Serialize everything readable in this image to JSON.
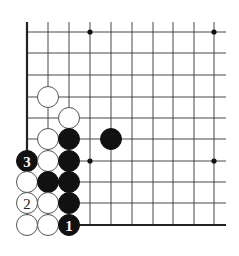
{
  "diagram": {
    "type": "go-board-fragment",
    "columns_x": [
      27,
      48,
      69,
      90,
      111,
      132,
      153,
      173,
      194,
      214
    ],
    "rows_y": [
      32,
      53,
      75,
      97,
      118,
      139,
      161,
      182,
      203,
      225
    ],
    "line_extent": {
      "top": 22,
      "right": 226
    },
    "edges": [
      "left",
      "bottom"
    ],
    "hoshi": [
      {
        "col": 3,
        "row": 0
      },
      {
        "col": 9,
        "row": 0
      },
      {
        "col": 3,
        "row": 6
      },
      {
        "col": 9,
        "row": 6
      }
    ],
    "stones": [
      {
        "color": "white",
        "col": 1,
        "row": 3,
        "label": ""
      },
      {
        "color": "white",
        "col": 2,
        "row": 4,
        "label": ""
      },
      {
        "color": "white",
        "col": 1,
        "row": 5,
        "label": ""
      },
      {
        "color": "black",
        "col": 2,
        "row": 5,
        "label": ""
      },
      {
        "color": "black",
        "col": 4,
        "row": 5,
        "label": ""
      },
      {
        "color": "black",
        "col": 0,
        "row": 6,
        "label": "3"
      },
      {
        "color": "white",
        "col": 1,
        "row": 6,
        "label": ""
      },
      {
        "color": "black",
        "col": 2,
        "row": 6,
        "label": ""
      },
      {
        "color": "white",
        "col": 0,
        "row": 7,
        "label": ""
      },
      {
        "color": "black",
        "col": 1,
        "row": 7,
        "label": ""
      },
      {
        "color": "black",
        "col": 2,
        "row": 7,
        "label": ""
      },
      {
        "color": "white",
        "col": 0,
        "row": 8,
        "label": "2"
      },
      {
        "color": "white",
        "col": 1,
        "row": 8,
        "label": ""
      },
      {
        "color": "black",
        "col": 2,
        "row": 8,
        "label": ""
      },
      {
        "color": "white",
        "col": 0,
        "row": 9,
        "label": ""
      },
      {
        "color": "white",
        "col": 1,
        "row": 9,
        "label": ""
      },
      {
        "color": "black",
        "col": 2,
        "row": 9,
        "label": "1"
      }
    ],
    "stone_radius": 10.5,
    "colors": {
      "background": "#ffffff",
      "line": "#333333",
      "black_stone": "#111111",
      "white_stone": "#ffffff"
    }
  }
}
